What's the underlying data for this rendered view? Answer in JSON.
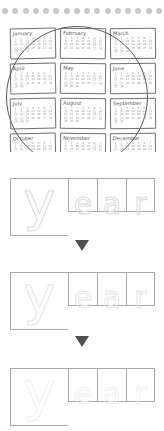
{
  "worksheet": {
    "title": "year",
    "dot_strip": {
      "name": "decorative-dot-row",
      "count": 16,
      "color": "#c9c9c9"
    },
    "calendar": {
      "circle_highlight": true,
      "circle_color": "#5a5a5a",
      "months": [
        {
          "name": "January",
          "days": [
            "1",
            "2",
            "3",
            "4",
            "5",
            "6",
            "7",
            "8",
            "9",
            "10",
            "11",
            "12",
            "13",
            "14",
            "15",
            "16",
            "17",
            "18",
            "19",
            "20",
            "21",
            "22",
            "23",
            "24",
            "25",
            "26",
            "27",
            "28",
            "29",
            "30",
            "31"
          ]
        },
        {
          "name": "February",
          "days": [
            "1",
            "2",
            "3",
            "4",
            "5",
            "6",
            "7",
            "8",
            "9",
            "10",
            "11",
            "12",
            "13",
            "14",
            "15",
            "16",
            "17",
            "18",
            "19",
            "20",
            "21",
            "22",
            "23",
            "24",
            "25",
            "26",
            "27",
            "28"
          ]
        },
        {
          "name": "March",
          "days": [
            "1",
            "2",
            "3",
            "4",
            "5",
            "6",
            "7",
            "8",
            "9",
            "10",
            "11",
            "12",
            "13",
            "14",
            "15",
            "16",
            "17",
            "18",
            "19",
            "20",
            "21",
            "22",
            "23",
            "24",
            "25",
            "26",
            "27",
            "28",
            "29",
            "30",
            "31"
          ]
        },
        {
          "name": "April",
          "days": [
            "1",
            "2",
            "3",
            "4",
            "5",
            "6",
            "7",
            "8",
            "9",
            "10",
            "11",
            "12",
            "13",
            "14",
            "15",
            "16",
            "17",
            "18",
            "19",
            "20",
            "21",
            "22",
            "23",
            "24",
            "25",
            "26",
            "27",
            "28",
            "29",
            "30"
          ]
        },
        {
          "name": "May",
          "days": [
            "1",
            "2",
            "3",
            "4",
            "5",
            "6",
            "7",
            "8",
            "9",
            "10",
            "11",
            "12",
            "13",
            "14",
            "15",
            "16",
            "17",
            "18",
            "19",
            "20",
            "21",
            "22",
            "23",
            "24",
            "25",
            "26",
            "27",
            "28",
            "29",
            "30",
            "31"
          ]
        },
        {
          "name": "June",
          "days": [
            "1",
            "2",
            "3",
            "4",
            "5",
            "6",
            "7",
            "8",
            "9",
            "10",
            "11",
            "12",
            "13",
            "14",
            "15",
            "16",
            "17",
            "18",
            "19",
            "20",
            "21",
            "22",
            "23",
            "24",
            "25",
            "26",
            "27",
            "28",
            "29",
            "30"
          ]
        },
        {
          "name": "July",
          "days": [
            "1",
            "2",
            "3",
            "4",
            "5",
            "6",
            "7",
            "8",
            "9",
            "10",
            "11",
            "12",
            "13",
            "14",
            "15",
            "16",
            "17",
            "18",
            "19",
            "20",
            "21",
            "22",
            "23",
            "24",
            "25",
            "26",
            "27",
            "28",
            "29",
            "30",
            "31"
          ]
        },
        {
          "name": "August",
          "days": [
            "1",
            "2",
            "3",
            "4",
            "5",
            "6",
            "7",
            "8",
            "9",
            "10",
            "11",
            "12",
            "13",
            "14",
            "15",
            "16",
            "17",
            "18",
            "19",
            "20",
            "21",
            "22",
            "23",
            "24",
            "25",
            "26",
            "27",
            "28",
            "29",
            "30",
            "31"
          ]
        },
        {
          "name": "September",
          "days": [
            "1",
            "2",
            "3",
            "4",
            "5",
            "6",
            "7",
            "8",
            "9",
            "10",
            "11",
            "12",
            "13",
            "14",
            "15",
            "16",
            "17",
            "18",
            "19",
            "20",
            "21",
            "22",
            "23",
            "24",
            "25",
            "26",
            "27",
            "28",
            "29",
            "30"
          ]
        },
        {
          "name": "October",
          "days": [
            "1",
            "2",
            "3",
            "4",
            "5",
            "6",
            "7",
            "8",
            "9",
            "10",
            "11",
            "12",
            "13",
            "14",
            "15",
            "16",
            "17",
            "18",
            "19",
            "20",
            "21",
            "22",
            "23",
            "24",
            "25",
            "26",
            "27",
            "28",
            "29",
            "30",
            "31"
          ]
        },
        {
          "name": "November",
          "days": [
            "1",
            "2",
            "3",
            "4",
            "5",
            "6",
            "7",
            "8",
            "9",
            "10",
            "11",
            "12",
            "13",
            "14",
            "15",
            "16",
            "17",
            "18",
            "19",
            "20",
            "21",
            "22",
            "23",
            "24",
            "25",
            "26",
            "27",
            "28",
            "29",
            "30"
          ]
        },
        {
          "name": "December",
          "days": [
            "1",
            "2",
            "3",
            "4",
            "5",
            "6",
            "7",
            "8",
            "9",
            "10",
            "11",
            "12",
            "13",
            "14",
            "15",
            "16",
            "17",
            "18",
            "19",
            "20",
            "21",
            "22",
            "23",
            "24",
            "25",
            "26",
            "27",
            "28",
            "29",
            "30",
            "31"
          ]
        }
      ]
    },
    "tracing_rows": [
      {
        "level": 1,
        "letters": [
          "y",
          "e",
          "a",
          "r"
        ],
        "stroke_color": "#dcdcdc"
      },
      {
        "level": 2,
        "letters": [
          "y",
          "e",
          "a",
          "r"
        ],
        "stroke_color": "#e4e4e4"
      },
      {
        "level": 3,
        "letters": [
          "y",
          "e",
          "a",
          "r"
        ],
        "stroke_color": "#efefef"
      }
    ],
    "arrows": [
      {
        "direction": "down",
        "color": "#4f4f4f"
      },
      {
        "direction": "down",
        "color": "#4f4f4f"
      }
    ]
  }
}
